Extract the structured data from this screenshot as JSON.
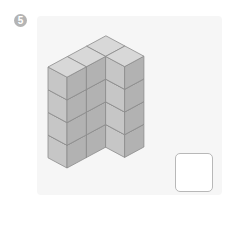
{
  "problem": {
    "number": "5",
    "figure": {
      "type": "isometric-cube-stack",
      "layers": 4,
      "cells": [
        [
          0,
          0
        ],
        [
          0,
          1
        ],
        [
          0,
          2
        ],
        [
          1,
          2
        ]
      ],
      "origin": [
        48,
        67
      ],
      "axis_a": [
        19,
        10.2
      ],
      "axis_b": [
        19.3,
        -10.4
      ],
      "cube_height": 22.7,
      "colors": {
        "top": "#d8d8d8",
        "left": "#c6c6c6",
        "right": "#b2b2b2",
        "edge": "#8c8c8c"
      }
    },
    "answer": ""
  }
}
